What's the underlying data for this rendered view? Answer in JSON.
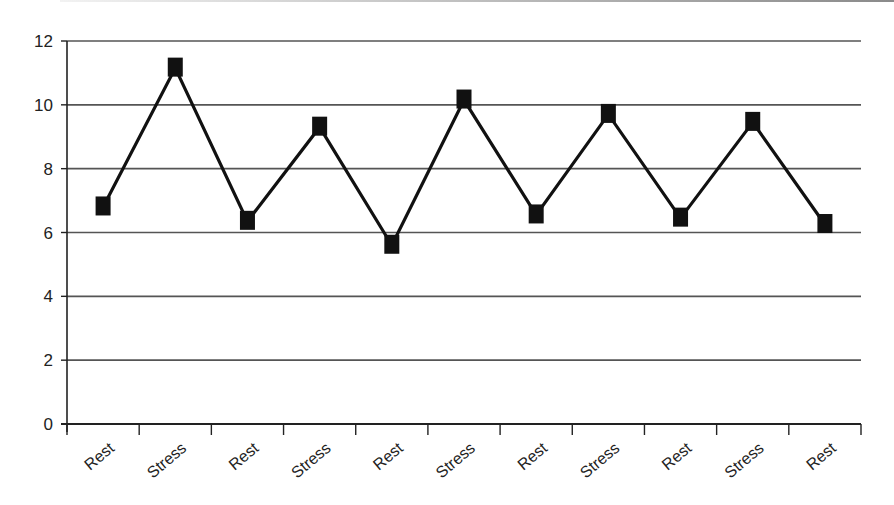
{
  "chart_data": {
    "type": "line",
    "title": "",
    "xlabel": "",
    "ylabel": "",
    "categories": [
      "Rest",
      "Stress",
      "Rest",
      "Stress",
      "Rest",
      "Stress",
      "Rest",
      "Stress",
      "Rest",
      "Stress",
      "Rest"
    ],
    "series": [
      {
        "name": "Series 1",
        "values": [
          6.8,
          11.15,
          6.35,
          9.3,
          5.6,
          10.15,
          6.55,
          9.7,
          6.45,
          9.45,
          6.25
        ],
        "color": "#111111",
        "marker": "square"
      }
    ],
    "ylim": [
      0,
      12
    ],
    "yticks": [
      0,
      2,
      4,
      6,
      8,
      10,
      12
    ],
    "grid": true,
    "legend": "none"
  },
  "colors": {
    "line": "#111111",
    "grid": "#555555",
    "axis": "#222222",
    "text": "#222222"
  }
}
